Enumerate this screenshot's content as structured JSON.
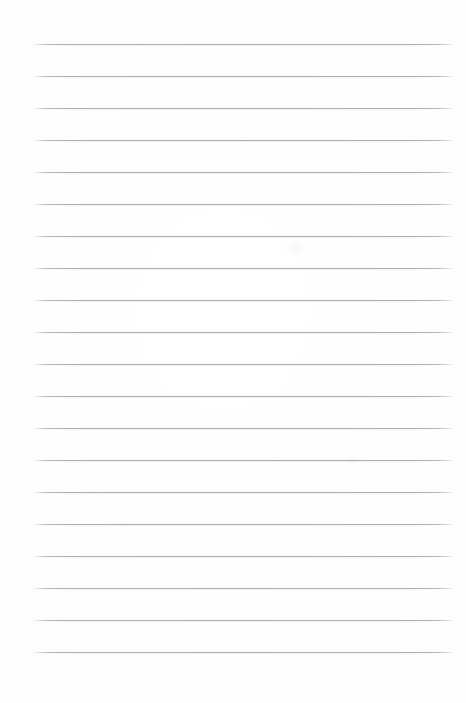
{
  "document": {
    "kind": "blank-ruled-paper-scan",
    "title": "Blank Ruled Notebook Page",
    "page_width": 466,
    "page_height": 703,
    "background_color": "#ffffff",
    "text_content": "",
    "has_text": false,
    "has_header": false,
    "has_margin_rule": false,
    "has_page_number": false
  },
  "ruling": {
    "line_color": "#b8b8b8",
    "line_thickness_px": 1,
    "line_count": 20,
    "line_start_x": 32,
    "line_end_x": 454,
    "line_length_px": 422,
    "first_line_y": 44,
    "last_line_y": 654,
    "line_spacing_px": 32.1,
    "left_margin_px": 32,
    "right_margin_px": 12,
    "top_margin_px": 44,
    "bottom_margin_px": 49,
    "line_positions_y": [
      44,
      76,
      108,
      140,
      172,
      204,
      236,
      268,
      300,
      332,
      364,
      396,
      428,
      460,
      492,
      524,
      556,
      588,
      620,
      652
    ]
  },
  "artifacts": {
    "smudges": [
      {
        "x": 288,
        "y": 243,
        "w": 16,
        "h": 9,
        "opacity": 0.06
      },
      {
        "x": 344,
        "y": 457,
        "w": 13,
        "h": 7,
        "opacity": 0.05
      },
      {
        "x": 120,
        "y": 523,
        "w": 10,
        "h": 6,
        "opacity": 0.04
      }
    ]
  }
}
